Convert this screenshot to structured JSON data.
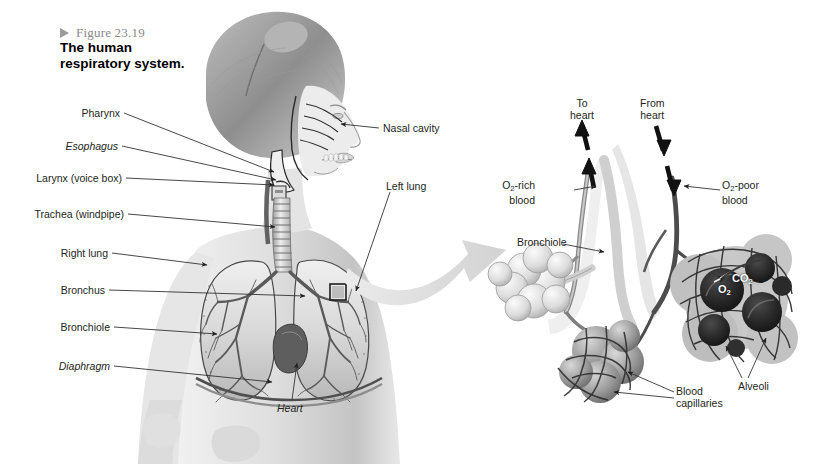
{
  "figure": {
    "number": "Figure 23.19",
    "title_line1": "The human",
    "title_line2": "respiratory system.",
    "triangle_icon": "triangle-right-icon"
  },
  "left_panel": {
    "labels": [
      {
        "id": "pharynx",
        "text": "Pharynx",
        "italic": false,
        "x": 120,
        "y": 108,
        "lx": 124,
        "ly": 113,
        "ex": 274,
        "ey": 172
      },
      {
        "id": "esophagus",
        "text": "Esophagus",
        "italic": true,
        "x": 118,
        "y": 141,
        "lx": 122,
        "ly": 146,
        "ex": 276,
        "ey": 180
      },
      {
        "id": "larynx",
        "text": "Larynx (voice box)",
        "italic": false,
        "x": 122,
        "y": 173,
        "lx": 126,
        "ly": 178,
        "ex": 274,
        "ey": 185
      },
      {
        "id": "trachea",
        "text": "Trachea (windpipe)",
        "italic": false,
        "x": 124,
        "y": 209,
        "lx": 128,
        "ly": 214,
        "ex": 275,
        "ey": 227
      },
      {
        "id": "right-lung",
        "text": "Right lung",
        "italic": false,
        "x": 108,
        "y": 248,
        "lx": 112,
        "ly": 253,
        "ex": 207,
        "ey": 265
      },
      {
        "id": "bronchus",
        "text": "Bronchus",
        "italic": false,
        "x": 105,
        "y": 285,
        "lx": 109,
        "ly": 290,
        "ex": 305,
        "ey": 296
      },
      {
        "id": "bronchiole",
        "text": "Bronchiole",
        "italic": false,
        "x": 110,
        "y": 322,
        "lx": 114,
        "ly": 327,
        "ex": 217,
        "ey": 334
      },
      {
        "id": "diaphragm",
        "text": "Diaphragm",
        "italic": true,
        "x": 110,
        "y": 361,
        "lx": 114,
        "ly": 366,
        "ex": 272,
        "ey": 382
      }
    ],
    "right_labels": [
      {
        "id": "nasal-cavity",
        "text": "Nasal cavity",
        "x": 383,
        "y": 123,
        "lx": 379,
        "ly": 128,
        "ex": 341,
        "ey": 124
      },
      {
        "id": "left-lung",
        "text": "Left lung",
        "x": 386,
        "y": 181,
        "lx": 390,
        "ly": 192,
        "ex": 356,
        "ey": 291
      }
    ],
    "heart_label": {
      "id": "heart",
      "text": "Heart",
      "x": 277,
      "y": 403,
      "lx": 292,
      "ly": 400,
      "ex": 297,
      "ey": 363
    }
  },
  "right_panel": {
    "labels": [
      {
        "id": "to-heart",
        "line1": "To",
        "line2": "heart",
        "x": 570,
        "y": 98
      },
      {
        "id": "from-heart",
        "line1": "From",
        "line2": "heart",
        "x": 640,
        "y": 98
      },
      {
        "id": "o2-rich-blood",
        "line1": "O2-rich",
        "line2": "blood",
        "x": 535,
        "y": 180,
        "align": "right"
      },
      {
        "id": "o2-poor-blood",
        "line1": "O2-poor",
        "line2": "blood",
        "x": 722,
        "y": 180,
        "align": "left"
      },
      {
        "id": "bronchiole",
        "line1": "Bronchiole",
        "line2": "",
        "x": 517,
        "y": 237,
        "align": "left"
      },
      {
        "id": "alveoli",
        "line1": "Alveoli",
        "line2": "",
        "x": 738,
        "y": 381,
        "align": "left"
      },
      {
        "id": "blood-capillaries",
        "line1": "Blood",
        "line2": "capillaries",
        "x": 676,
        "y": 386,
        "align": "left"
      }
    ],
    "gas_exchange": {
      "o2": "O2",
      "co2": "CO2"
    },
    "flow_arrows": [
      {
        "id": "to-heart-arrow",
        "direction": "up"
      },
      {
        "id": "from-heart-arrow",
        "direction": "down"
      }
    ]
  },
  "colors": {
    "background": "#ffffff",
    "label_text": "#231f20",
    "caption_number": "#8a8a8a",
    "leader_line": "#3a3a3a",
    "zoom_arrow": "#dcdcdc",
    "illustration_dark": "#3b3b3b",
    "illustration_mid": "#9b9b9b",
    "illustration_light": "#e3e3e3"
  }
}
